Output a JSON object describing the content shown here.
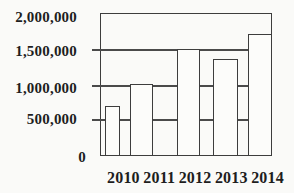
{
  "figure": {
    "background_color": "#fafaf8",
    "line_color": "#3d3d3d",
    "text_color": "#1e1e1e",
    "bar_fill_color": "#fcfcfa"
  },
  "chart_data": {
    "type": "bar",
    "title": "",
    "xlabel": "",
    "ylabel": "",
    "categories": [
      "2010",
      "2011",
      "2012",
      "2013",
      "2014"
    ],
    "values": [
      700000,
      1000000,
      1500000,
      1350000,
      1700000
    ],
    "ylim": [
      0,
      2000000
    ],
    "y_tick_values": [
      2000000,
      1500000,
      1000000,
      500000,
      0
    ],
    "y_tick_labels": [
      "2,000,000",
      "1,500,000",
      "1,000,000",
      "500,000",
      "0"
    ],
    "grid": "horizontal gridlines every 500,000, drawn across plot, hidden behind bars",
    "legend": "none",
    "bar_style": "white fill with black outline, plot area boxed"
  }
}
